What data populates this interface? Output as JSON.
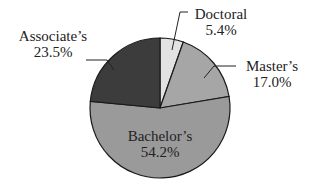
{
  "chart_data": {
    "type": "pie",
    "title": "",
    "start_angle_deg": 0,
    "direction": "clockwise",
    "slices": [
      {
        "label": "Doctoral",
        "value": 5.4,
        "display": "5.4%",
        "color": "#e2e2e2"
      },
      {
        "label": "Master's",
        "value": 17.0,
        "display": "17.0%",
        "color": "#a6a6a6"
      },
      {
        "label": "Bachelor's",
        "value": 54.2,
        "display": "54.2%",
        "color": "#9a9a9a"
      },
      {
        "label": "Associate's",
        "value": 23.5,
        "display": "23.5%",
        "color": "#3c3c3c"
      }
    ],
    "legend": "none (direct labels)"
  },
  "labels": {
    "doctoral": {
      "name": "Doctoral",
      "pct": "5.4%"
    },
    "masters": {
      "name": "Master’s",
      "pct": "17.0%"
    },
    "bachelors": {
      "name": "Bachelor’s",
      "pct": "54.2%"
    },
    "associates": {
      "name": "Associate’s",
      "pct": "23.5%"
    }
  }
}
